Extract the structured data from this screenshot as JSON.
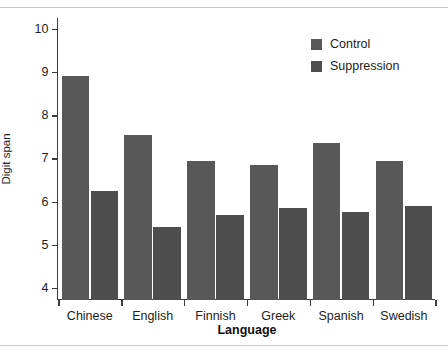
{
  "chart_data": {
    "type": "bar",
    "title": "",
    "subtitle": "",
    "xlabel": "Language",
    "ylabel": "Digit span",
    "categories": [
      "Chinese",
      "English",
      "Finnish",
      "Greek",
      "Spanish",
      "Swedish"
    ],
    "series": [
      {
        "name": "Control",
        "color": "#585858",
        "values": [
          8.9,
          7.55,
          6.95,
          6.85,
          7.35,
          6.95
        ]
      },
      {
        "name": "Suppression",
        "color": "#4e4e4e",
        "values": [
          6.25,
          5.4,
          5.7,
          5.85,
          5.75,
          5.9
        ]
      }
    ],
    "ylim": [
      3.72,
      10.25
    ],
    "yticks": [
      4,
      5,
      6,
      7,
      8,
      9,
      10
    ],
    "ytick_labels": [
      "4",
      "5",
      "6",
      "7",
      "8",
      "9",
      "10"
    ],
    "grid": false,
    "legend_position": "top-right",
    "axis_color": "#3c3c3c",
    "background": "#ffffff"
  },
  "legend": {
    "entries": [
      {
        "label": "Control"
      },
      {
        "label": "Suppression"
      }
    ]
  }
}
